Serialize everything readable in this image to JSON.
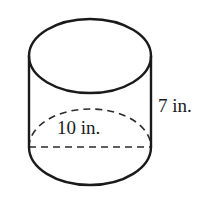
{
  "figure": {
    "name": "cylinder",
    "type": "3d-solid-geometry-diagram",
    "shape": "right circular cylinder",
    "background_color": "#ffffff",
    "stroke_color": "#1a1a1a",
    "hidden_edge_color": "#2b2b2b",
    "hidden_edge_style": "dashed",
    "labels": {
      "diameter": "10 in.",
      "height": "7 in."
    },
    "measurements": [
      {
        "name": "diameter",
        "value": 10,
        "unit": "in.",
        "text": "10 in."
      },
      {
        "name": "height",
        "value": 7,
        "unit": "in.",
        "text": "7 in."
      }
    ],
    "geometry": {
      "left_edge_x": 29,
      "right_edge_x": 151,
      "top_ellipse_center_y": 56,
      "top_ellipse_ry": 37,
      "bottom_ellipse_center_y": 147,
      "bottom_ellipse_ry": 38,
      "radius_x": 61
    }
  }
}
